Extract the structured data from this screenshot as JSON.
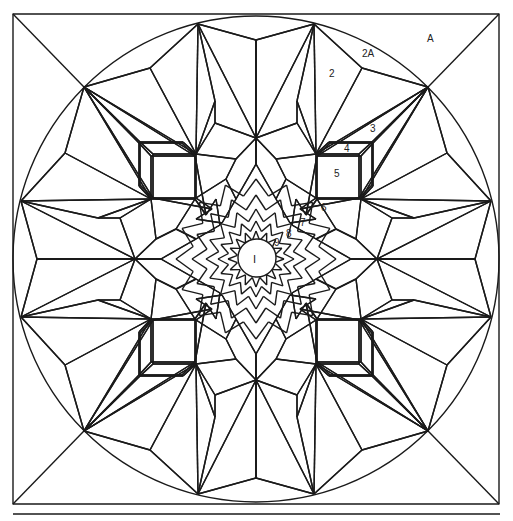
{
  "diagram": {
    "line_color": "#1a1a1a",
    "background": "#ffffff",
    "symmetry": "8-fold star inside circle inside square",
    "labels": {
      "corner": "A",
      "piece_2a": "2A",
      "piece_2": "2",
      "piece_3": "3",
      "piece_4": "4",
      "piece_5": "5",
      "piece_6": "6",
      "piece_7": "7",
      "piece_8": "8",
      "piece_9": "9",
      "center": "I"
    }
  }
}
